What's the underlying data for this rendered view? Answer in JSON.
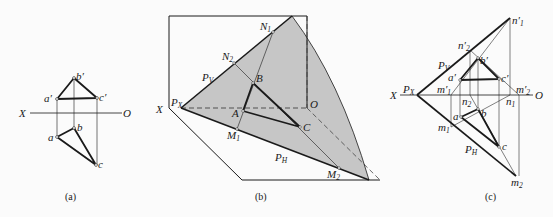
{
  "figure": {
    "panels": [
      {
        "id": "a",
        "caption": "(a)",
        "axis": {
          "left": "X",
          "right": "O"
        },
        "points": {
          "b_prime": "b′",
          "a_prime": "a′",
          "c_prime": "c′",
          "b": "b",
          "a": "a",
          "c": "c"
        }
      },
      {
        "id": "b",
        "caption": "(b)",
        "labels": {
          "X": "X",
          "PX": "P",
          "PX_sub": "X",
          "PV": "P",
          "PV_sub": "V",
          "PH": "P",
          "PH_sub": "H",
          "N1": "N",
          "N1_sub": "1",
          "N2": "N",
          "N2_sub": "2",
          "M1": "M",
          "M1_sub": "1",
          "M2": "M",
          "M2_sub": "2",
          "A": "A",
          "B": "B",
          "C": "C",
          "O": "O"
        }
      },
      {
        "id": "c",
        "caption": "(c)",
        "axis": {
          "left": "X",
          "right": "O"
        },
        "labels": {
          "PX": "P",
          "PX_sub": "X",
          "PV": "P",
          "PV_sub": "V",
          "PH": "P",
          "PH_sub": "H",
          "n1p": "n′",
          "n1p_sub": "1",
          "n2p": "n′",
          "n2p_sub": "2",
          "m1p": "m′",
          "m1p_sub": "1",
          "m2p": "m′",
          "m2p_sub": "2",
          "n1": "n",
          "n1_sub": "1",
          "n2": "n",
          "n2_sub": "2",
          "m1": "m",
          "m1_sub": "1",
          "m2": "m",
          "m2_sub": "2",
          "a_prime": "a′",
          "b_prime": "b′",
          "c_prime": "c′",
          "a": "a",
          "b": "b",
          "c": "c"
        }
      }
    ],
    "colors": {
      "plane_fill": "#c6c6c6",
      "line": "#1a1a1a"
    }
  }
}
